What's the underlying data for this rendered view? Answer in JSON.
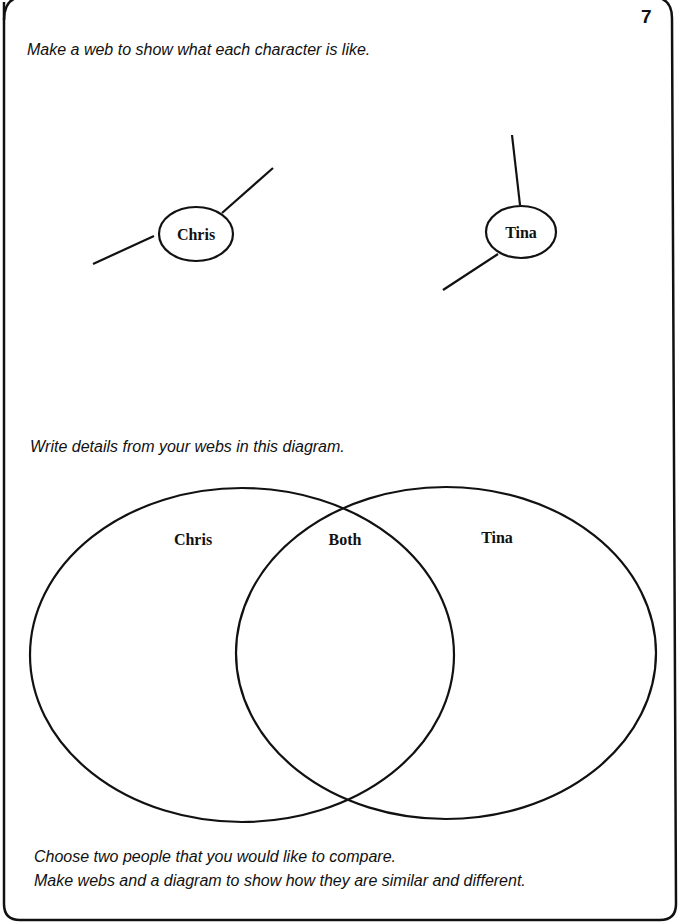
{
  "page_number": "7",
  "section1": {
    "instruction": "Make a web to show what each character is like.",
    "webs": [
      {
        "label": "Chris"
      },
      {
        "label": "Tina"
      }
    ]
  },
  "section2": {
    "instruction": "Write details from your webs in this diagram.",
    "venn": {
      "left_label": "Chris",
      "middle_label": "Both",
      "right_label": "Tina"
    }
  },
  "footer": {
    "line1": "Choose two people that you would like to compare.",
    "line2": "Make webs and a diagram to show how they are similar and different."
  },
  "colors": {
    "ink": "#111111",
    "paper": "#ffffff"
  }
}
